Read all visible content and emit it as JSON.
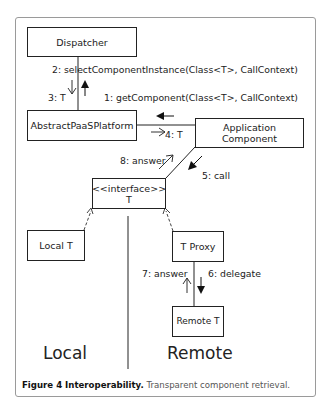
{
  "figure": {
    "caption_label": "Figure 4 Interoperability.",
    "caption_text": " Transparent component retrieval."
  },
  "nodes": {
    "dispatcher": "Dispatcher",
    "platform": "AbstractPaaSPlatform",
    "app_component": "Application Component",
    "interface_stereotype": "<<interface>>",
    "interface_name": "T",
    "local_t": "Local T",
    "t_proxy": "T Proxy",
    "remote_t": "Remote T"
  },
  "messages": {
    "m1": "1: getComponent(Class<T>, CallContext)",
    "m2": "2: selectComponentInstance(Class<T>, CallContext)",
    "m3": "3: T",
    "m4": "4: T",
    "m5": "5: call",
    "m6": "6: delegate",
    "m7": "7: answer",
    "m8": "8: answer"
  },
  "regions": {
    "local": "Local",
    "remote": "Remote"
  }
}
